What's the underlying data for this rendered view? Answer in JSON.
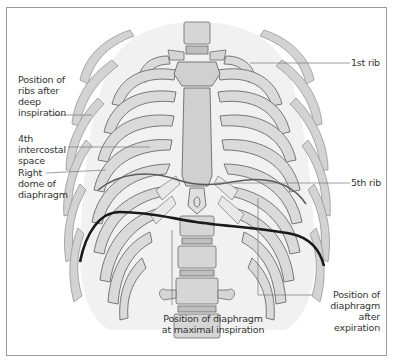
{
  "figure": {
    "type": "anatomical illustration",
    "colors": {
      "bone": "#d9d9d9",
      "bone_dark": "#b8b8b8",
      "outline": "#6a6a6a",
      "background_lung": "#efefef",
      "inspiration_line": "#1a1a1a",
      "expiration_line": "#5a5a5a",
      "leader_line": "#777777",
      "frame": "#9a9a9a"
    }
  },
  "labels": {
    "first_rib": "1st rib",
    "ribs_deep_inspiration": [
      "Position of",
      "ribs after",
      "deep",
      "inspiration"
    ],
    "fourth_intercostal": [
      "4th",
      "intercostal",
      "space"
    ],
    "right_dome": [
      "Right",
      "dome of",
      "diaphragm"
    ],
    "fifth_rib": "5th rib",
    "diaphragm_max_inspiration": [
      "Position of diaphragm",
      "at maximal inspiration"
    ],
    "diaphragm_after_expiration": [
      "Position of",
      "diaphragm",
      "after",
      "expiration"
    ]
  }
}
